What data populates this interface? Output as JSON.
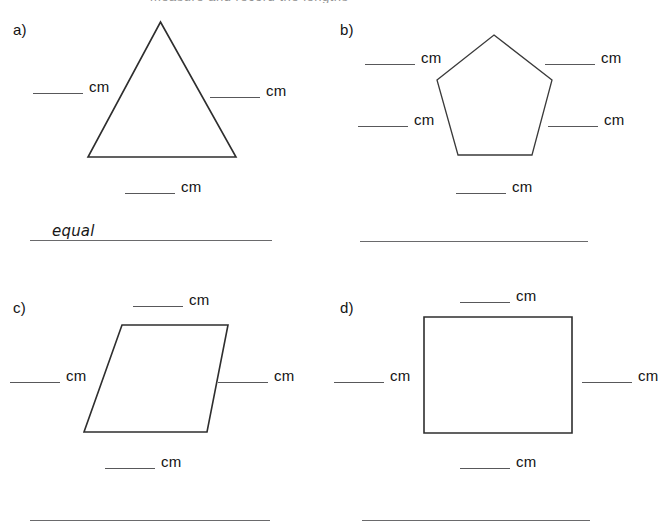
{
  "page": {
    "cropped_header_fragment": "measure and record the lengths"
  },
  "problems": [
    {
      "id": "a",
      "label": "a)",
      "shape": "triangle",
      "measurements": [
        {
          "position": "left",
          "unit": "cm",
          "value": ""
        },
        {
          "position": "right",
          "unit": "cm",
          "value": ""
        },
        {
          "position": "bottom",
          "unit": "cm",
          "value": ""
        }
      ],
      "answer": "equal"
    },
    {
      "id": "b",
      "label": "b)",
      "shape": "pentagon",
      "measurements": [
        {
          "position": "upper-left",
          "unit": "cm",
          "value": ""
        },
        {
          "position": "upper-right",
          "unit": "cm",
          "value": ""
        },
        {
          "position": "lower-left",
          "unit": "cm",
          "value": ""
        },
        {
          "position": "lower-right",
          "unit": "cm",
          "value": ""
        },
        {
          "position": "bottom",
          "unit": "cm",
          "value": ""
        }
      ],
      "answer": ""
    },
    {
      "id": "c",
      "label": "c)",
      "shape": "parallelogram",
      "measurements": [
        {
          "position": "top",
          "unit": "cm",
          "value": ""
        },
        {
          "position": "left",
          "unit": "cm",
          "value": ""
        },
        {
          "position": "right",
          "unit": "cm",
          "value": ""
        },
        {
          "position": "bottom",
          "unit": "cm",
          "value": ""
        }
      ],
      "answer": ""
    },
    {
      "id": "d",
      "label": "d)",
      "shape": "rectangle",
      "measurements": [
        {
          "position": "top",
          "unit": "cm",
          "value": ""
        },
        {
          "position": "left",
          "unit": "cm",
          "value": ""
        },
        {
          "position": "right",
          "unit": "cm",
          "value": ""
        },
        {
          "position": "bottom",
          "unit": "cm",
          "value": ""
        }
      ],
      "answer": ""
    }
  ],
  "colors": {
    "ink": "#2e2e2e",
    "rule": "#58585a",
    "page": "#ffffff"
  }
}
